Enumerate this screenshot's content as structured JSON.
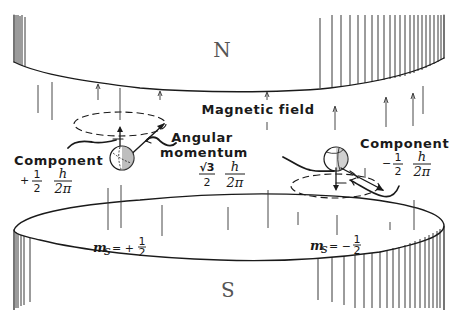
{
  "diagram": {
    "top_magnet": {
      "pole_label": "N"
    },
    "bottom_magnet": {
      "pole_label": "S"
    },
    "field_label": "Magnetic field",
    "angular_momentum": {
      "label_line1": "Angular",
      "label_line2": "momentum",
      "coef_num": "√3",
      "coef_den": "2",
      "h_num": "h",
      "h_den": "2π"
    },
    "left_spin": {
      "component_label": "Component",
      "sign": "+",
      "frac_num": "1",
      "frac_den": "2",
      "h_num": "h",
      "h_den": "2π",
      "ms_label": "m",
      "ms_sub": "s",
      "ms_value_sign": "= +",
      "ms_num": "1",
      "ms_den": "2"
    },
    "right_spin": {
      "component_label": "Component",
      "sign": "−",
      "frac_num": "1",
      "frac_den": "2",
      "h_num": "h",
      "h_den": "2π",
      "ms_label": "m",
      "ms_sub": "s",
      "ms_value_sign": "= −",
      "ms_num": "1",
      "ms_den": "2"
    }
  }
}
